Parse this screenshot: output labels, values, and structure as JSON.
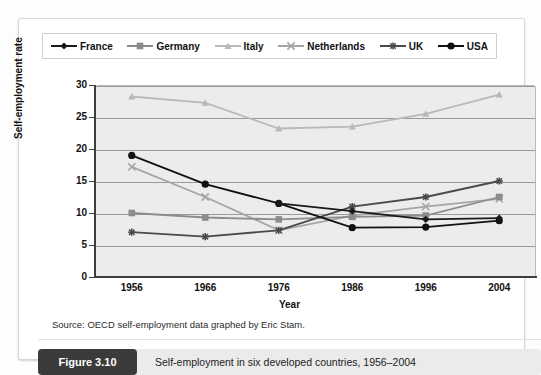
{
  "figure": {
    "badge": "Figure 3.10",
    "caption": "Self-employment in six developed countries, 1956–2004",
    "source": "Source: OECD self-employment data graphed by Eric Stam."
  },
  "chart_data": {
    "type": "line",
    "title": "",
    "xlabel": "Year",
    "ylabel": "Self-employment rate",
    "categories": [
      "1956",
      "1966",
      "1976",
      "1986",
      "1996",
      "2004"
    ],
    "x": [
      1956,
      1966,
      1976,
      1986,
      1996,
      2004
    ],
    "ylim": [
      0,
      30
    ],
    "yticks": [
      "0",
      "5",
      "10",
      "15",
      "20",
      "25",
      "30"
    ],
    "grid": true,
    "legend_position": "top",
    "series": [
      {
        "name": "France",
        "marker": "diamond",
        "color": "#1a1a1a",
        "values": [
          null,
          null,
          11.5,
          10.3,
          9.0,
          9.2
        ]
      },
      {
        "name": "Germany",
        "marker": "square",
        "color": "#8c8c8c",
        "values": [
          10.0,
          9.3,
          9.0,
          9.4,
          9.6,
          12.5
        ]
      },
      {
        "name": "Italy",
        "marker": "triangle",
        "color": "#b9b9b9",
        "values": [
          28.2,
          27.2,
          23.2,
          23.5,
          25.5,
          28.5
        ]
      },
      {
        "name": "Netherlands",
        "marker": "x",
        "color": "#a5a5a5",
        "values": [
          17.2,
          12.5,
          7.3,
          9.6,
          11.0,
          12.2
        ]
      },
      {
        "name": "UK",
        "marker": "asterisk",
        "color": "#4a4a4a",
        "values": [
          7.0,
          6.3,
          7.3,
          11.0,
          12.5,
          15.0
        ]
      },
      {
        "name": "USA",
        "marker": "circle",
        "color": "#111111",
        "values": [
          19.0,
          14.5,
          11.5,
          7.7,
          7.8,
          8.8
        ]
      }
    ]
  }
}
